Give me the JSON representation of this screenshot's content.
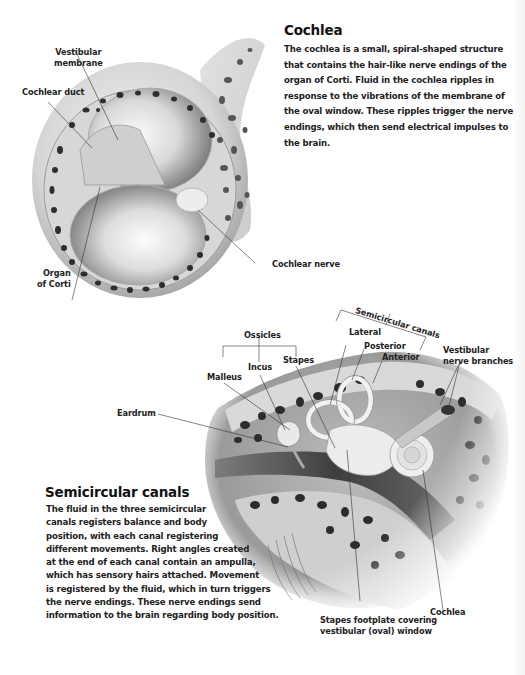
{
  "cochlea_section": {
    "heading": "Cochlea",
    "body_lines": [
      "The cochlea is a small, spiral-shaped structure",
      "that contains the hair-like nerve endings of the",
      "organ of Corti. Fluid in the cochlea ripples in",
      "response to the vibrations of the membrane of",
      "the oval window. These ripples trigger the nerve",
      "endings, which then send electrical impulses to",
      "the brain."
    ],
    "labels": {
      "vestibular_membrane": [
        "Vestibular",
        "membrane"
      ],
      "cochlear_duct": "Cochlear duct",
      "organ_of_corti": [
        "Organ",
        "of Corti"
      ],
      "cochlear_nerve": "Cochlear nerve"
    }
  },
  "ear_section": {
    "labels": {
      "ossicles": "Ossicles",
      "malleus": "Malleus",
      "incus": "Incus",
      "stapes": "Stapes",
      "eardrum": "Eardrum",
      "semicircular_canals": "Semicircular canals",
      "lateral": "Lateral",
      "posterior": "Posterior",
      "anterior": "Anterior",
      "vestibular_nerve_branches": [
        "Vestibular",
        "nerve branches"
      ],
      "stapes_footplate": [
        "Stapes footplate covering",
        "vestibular (oval) window"
      ],
      "cochlea": "Cochlea"
    }
  },
  "semicircular_section": {
    "heading": "Semicircular canals",
    "body_lines": [
      "The fluid in the three semicircular",
      "canals registers balance and body",
      "position, with each canal registering",
      "different movements. Right angles created",
      "at the end of each canal contain an ampulla,",
      "which has sensory hairs attached. Movement",
      "is registered by the fluid, which in turn triggers",
      "the nerve endings. These nerve endings send",
      "information to the brain regarding body position."
    ]
  }
}
